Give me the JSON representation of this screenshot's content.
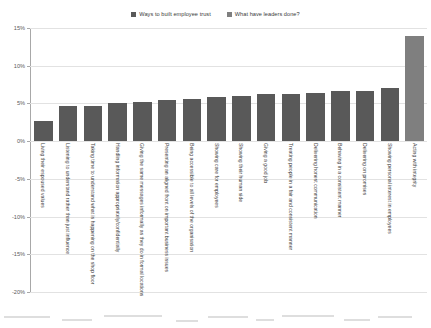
{
  "legend": {
    "position": "top-center",
    "entries": [
      {
        "label": "Ways to built employee trust",
        "color": "#595959",
        "icon": "square-swatch"
      },
      {
        "label": "What have leaders done?",
        "color": "#7f7f7f",
        "icon": "square-swatch"
      }
    ]
  },
  "axes": {
    "y": {
      "ticks": [
        "15%",
        "10%",
        "5%",
        "0%",
        "-5%",
        "-10%",
        "-15%",
        "-20%"
      ],
      "values": [
        15,
        10,
        5,
        0,
        -5,
        -10,
        -15,
        -20
      ],
      "min": -20,
      "max": 15,
      "grid": true
    },
    "x": {
      "label": "",
      "grid": false
    }
  },
  "chart_data": {
    "type": "bar",
    "title": "",
    "subtitle": "",
    "xlabel": "",
    "ylabel": "",
    "ylim": [
      -20,
      15
    ],
    "grid": true,
    "legend_position": "top-center",
    "categories": [
      "Living their espoused values",
      "Listening to understand rather than just influence",
      "Taking time to understand what is happening on the shop floor",
      "Handling information appropriately/confidentially",
      "Giving the same messages informally as they do in formal locations",
      "Presenting an aligned front on important business issues",
      "Being accessible to all levels of the organisation",
      "Showing care for employees",
      "Showing their human side",
      "Giving a good job",
      "Treating people in a fair and consistent manner",
      "Delivering honest communication",
      "Behaving in a consistent manner",
      "Delivering on promises",
      "Showing personal interest in employees",
      "Acting with integrity"
    ],
    "series": [
      {
        "name": "Ways to built employee trust",
        "color": "#595959",
        "values": [
          2.7,
          4.6,
          4.6,
          5.1,
          5.2,
          5.4,
          5.6,
          5.8,
          6.0,
          6.2,
          6.3,
          6.4,
          6.6,
          6.7,
          7.0,
          null
        ]
      },
      {
        "name": "What have leaders done?",
        "color": "#7f7f7f",
        "values": [
          null,
          null,
          null,
          null,
          null,
          null,
          null,
          null,
          null,
          null,
          null,
          null,
          null,
          null,
          null,
          13.9
        ]
      }
    ]
  }
}
